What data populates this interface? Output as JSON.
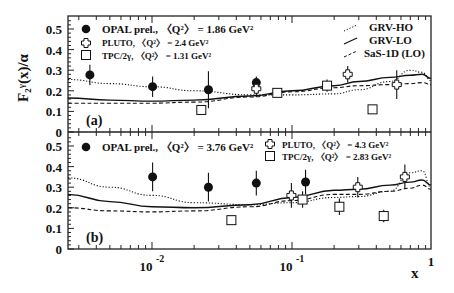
{
  "figure": {
    "ylabel": "F₂ᵞ(x)/α",
    "xlabel": "x",
    "xticks": [
      {
        "value": 0.01,
        "label": "10",
        "exp": "-2"
      },
      {
        "value": 0.1,
        "label": "10",
        "exp": "-1"
      },
      {
        "value": 1,
        "label": "1",
        "exp": ""
      }
    ],
    "yticks": [
      "0",
      "0.1",
      "0.2",
      "0.3",
      "0.4",
      "0.5"
    ],
    "panel_a_label": "(a)",
    "panel_b_label": "(b)",
    "legend_a": {
      "opal": "OPAL prel., 〈Q²〉 = 1.86 GeV²",
      "pluto": "PLUTO, 〈Q²〉 = 2.4 GeV²",
      "tpc": "TPC/2γ, 〈Q²〉 = 1.31 GeV²"
    },
    "legend_theory": {
      "grv_ho": "GRV-HO",
      "grv_lo": "GRV-LO",
      "sas": "SaS-1D (LO)"
    },
    "legend_b": {
      "opal": "OPAL prel., 〈Q²〉 = 3.76 GeV²",
      "pluto": "PLUTO, 〈Q²〉 = 4.3 GeV²",
      "tpc": "TPC/2γ, 〈Q²〉 = 2.83 GeV²"
    }
  },
  "chart_data": [
    {
      "type": "scatter",
      "title": "(a)",
      "xlabel": "x",
      "ylabel": "F2^gamma(x)/alpha",
      "xscale": "log",
      "xlim": [
        0.0025,
        1.0
      ],
      "ylim": [
        0,
        0.56
      ],
      "legend_position": "top",
      "series": [
        {
          "name": "OPAL prel., <Q2> = 1.86 GeV2",
          "marker": "filled-circle",
          "x": [
            0.0036,
            0.0101,
            0.0253,
            0.0556
          ],
          "y": [
            0.277,
            0.22,
            0.205,
            0.24
          ],
          "err": [
            0.05,
            0.05,
            0.09,
            0.03
          ]
        },
        {
          "name": "PLUTO, <Q2> = 2.4 GeV2",
          "marker": "open-cross",
          "x": [
            0.0556,
            0.25,
            0.56
          ],
          "y": [
            0.21,
            0.28,
            0.23
          ],
          "err": [
            0.04,
            0.04,
            0.07
          ]
        },
        {
          "name": "TPC/2gamma, <Q2> = 1.31 GeV2",
          "marker": "open-square",
          "x": [
            0.0225,
            0.0785,
            0.178,
            0.376
          ],
          "y": [
            0.107,
            0.19,
            0.225,
            0.11
          ],
          "err": [
            0.0,
            0.02,
            0.03,
            0.02
          ]
        },
        {
          "name": "GRV-HO",
          "style": "dotted",
          "x": [
            0.0025,
            0.005,
            0.01,
            0.02,
            0.05,
            0.1,
            0.2,
            0.3,
            0.5,
            0.7,
            0.85,
            1.0
          ],
          "y": [
            0.255,
            0.235,
            0.22,
            0.2,
            0.18,
            0.18,
            0.185,
            0.205,
            0.245,
            0.3,
            0.29,
            0.25
          ]
        },
        {
          "name": "GRV-LO",
          "style": "solid",
          "x": [
            0.0025,
            0.005,
            0.01,
            0.02,
            0.05,
            0.1,
            0.2,
            0.3,
            0.5,
            0.7,
            0.85,
            1.0
          ],
          "y": [
            0.165,
            0.155,
            0.15,
            0.155,
            0.175,
            0.2,
            0.225,
            0.245,
            0.265,
            0.275,
            0.28,
            0.26
          ]
        },
        {
          "name": "SaS-1D (LO)",
          "style": "dashed",
          "x": [
            0.0025,
            0.005,
            0.01,
            0.02,
            0.05,
            0.1,
            0.2,
            0.3,
            0.5,
            0.7,
            0.85,
            1.0
          ],
          "y": [
            0.14,
            0.14,
            0.14,
            0.145,
            0.17,
            0.195,
            0.215,
            0.225,
            0.23,
            0.235,
            0.24,
            0.23
          ]
        }
      ]
    },
    {
      "type": "scatter",
      "title": "(b)",
      "xlabel": "x",
      "ylabel": "F2^gamma(x)/alpha",
      "xscale": "log",
      "xlim": [
        0.0025,
        1.0
      ],
      "ylim": [
        0,
        0.56
      ],
      "legend_position": "top",
      "series": [
        {
          "name": "OPAL prel., <Q2> = 3.76 GeV2",
          "marker": "filled-circle",
          "x": [
            0.0101,
            0.0253,
            0.0556,
            0.125
          ],
          "y": [
            0.35,
            0.3,
            0.32,
            0.325
          ],
          "err": [
            0.07,
            0.07,
            0.06,
            0.06
          ]
        },
        {
          "name": "PLUTO, <Q2> = 4.3 GeV2",
          "marker": "open-cross",
          "x": [
            0.099,
            0.295,
            0.64
          ],
          "y": [
            0.26,
            0.3,
            0.35
          ],
          "err": [
            0.06,
            0.05,
            0.06
          ]
        },
        {
          "name": "TPC/2gamma, <Q2> = 2.83 GeV2",
          "marker": "open-square",
          "x": [
            0.0369,
            0.119,
            0.218,
            0.452
          ],
          "y": [
            0.14,
            0.24,
            0.205,
            0.16
          ],
          "err": [
            0.0,
            0.04,
            0.04,
            0.03
          ]
        },
        {
          "name": "GRV-HO",
          "style": "dotted",
          "x": [
            0.0025,
            0.005,
            0.01,
            0.02,
            0.05,
            0.1,
            0.2,
            0.3,
            0.5,
            0.7,
            0.85,
            1.0
          ],
          "y": [
            0.345,
            0.3,
            0.26,
            0.225,
            0.215,
            0.225,
            0.25,
            0.255,
            0.28,
            0.37,
            0.38,
            0.3
          ]
        },
        {
          "name": "GRV-LO",
          "style": "solid",
          "x": [
            0.0025,
            0.005,
            0.01,
            0.02,
            0.05,
            0.1,
            0.2,
            0.3,
            0.5,
            0.7,
            0.85,
            1.0
          ],
          "y": [
            0.265,
            0.23,
            0.205,
            0.2,
            0.215,
            0.25,
            0.285,
            0.29,
            0.31,
            0.325,
            0.335,
            0.31
          ]
        },
        {
          "name": "SaS-1D (LO)",
          "style": "dashed",
          "x": [
            0.0025,
            0.005,
            0.01,
            0.02,
            0.05,
            0.1,
            0.2,
            0.3,
            0.5,
            0.7,
            0.85,
            1.0
          ],
          "y": [
            0.2,
            0.185,
            0.18,
            0.185,
            0.205,
            0.235,
            0.265,
            0.265,
            0.28,
            0.295,
            0.31,
            0.29
          ]
        }
      ]
    }
  ]
}
